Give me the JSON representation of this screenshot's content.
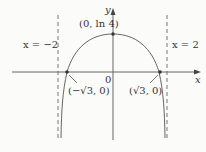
{
  "diagram": {
    "axes": {
      "x_label": "x",
      "y_label": "y",
      "origin_label": "0"
    },
    "asymptotes": [
      {
        "label": "x = −2",
        "x": -2
      },
      {
        "label": "x = 2",
        "x": 2
      }
    ],
    "points": [
      {
        "label": "(0, ln 4)",
        "x": 0,
        "y": 1.386
      },
      {
        "label": "(−√3, 0)",
        "x": -1.732,
        "y": 0
      },
      {
        "label": "(√3, 0)",
        "x": 1.732,
        "y": 0
      }
    ],
    "curve": "y = ln(4 − x²)",
    "colors": {
      "curve": "#555555",
      "axes": "#555555",
      "dashed": "#666666",
      "text": "#333333"
    }
  }
}
